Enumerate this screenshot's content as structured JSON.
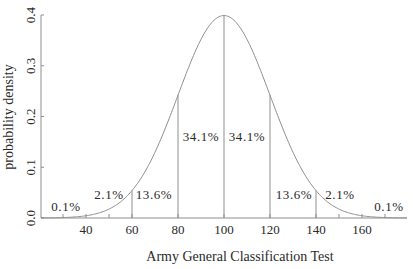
{
  "chart_data": {
    "type": "line",
    "title": "",
    "xlabel": "Army General Classification Test",
    "ylabel": "probability density",
    "xlim": [
      20,
      180
    ],
    "ylim": [
      0,
      0.4
    ],
    "x_ticks": [
      40,
      60,
      80,
      100,
      120,
      140,
      160
    ],
    "y_ticks": [
      0.0,
      0.1,
      0.2,
      0.3,
      0.4
    ],
    "y_tick_labels": [
      "0.0",
      "0.1",
      "0.2",
      "0.3",
      "0.4"
    ],
    "x_tick_labels": [
      "40",
      "60",
      "80",
      "100",
      "120",
      "140",
      "160"
    ],
    "grid": false,
    "legend": null,
    "distribution": {
      "name": "normal",
      "mean": 100,
      "sd": 20,
      "peak_density_shown": 0.4
    },
    "series": [
      {
        "name": "normal curve",
        "x": [
          20,
          30,
          40,
          50,
          60,
          70,
          80,
          90,
          100,
          110,
          120,
          130,
          140,
          150,
          160,
          170,
          180
        ],
        "values": [
          0.0001,
          0.0009,
          0.0044,
          0.0175,
          0.054,
          0.1295,
          0.242,
          0.3521,
          0.3989,
          0.3521,
          0.242,
          0.1295,
          0.054,
          0.0175,
          0.0044,
          0.0009,
          0.0001
        ]
      }
    ],
    "vertical_lines": [
      {
        "x": 60,
        "height": 0.054
      },
      {
        "x": 80,
        "height": 0.242
      },
      {
        "x": 100,
        "height": 0.3989
      },
      {
        "x": 120,
        "height": 0.242
      },
      {
        "x": 140,
        "height": 0.054
      }
    ],
    "region_annotations": [
      {
        "label": "0.1%",
        "region": "below 40"
      },
      {
        "label": "2.1%",
        "region": "40-60"
      },
      {
        "label": "13.6%",
        "region": "60-80"
      },
      {
        "label": "34.1%",
        "region": "80-100"
      },
      {
        "label": "34.1%",
        "region": "100-120"
      },
      {
        "label": "13.6%",
        "region": "120-140"
      },
      {
        "label": "2.1%",
        "region": "140-160"
      },
      {
        "label": "0.1%",
        "region": "above 160"
      }
    ]
  },
  "axes": {
    "xlabel": "Army General Classification Test",
    "ylabel": "probability density"
  },
  "style": {
    "curve_color": "#8f8f8f",
    "axis_color": "#8f8f8f",
    "text_color": "#2a2a2a",
    "background": "#ffffff"
  }
}
